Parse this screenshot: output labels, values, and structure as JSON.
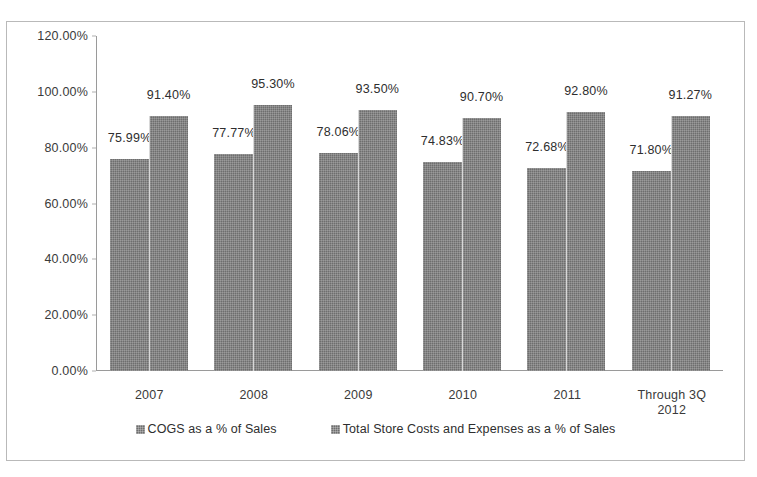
{
  "chart_data": {
    "type": "bar",
    "title": "",
    "subtitle": "",
    "xlabel": "",
    "ylabel": "",
    "ylim": [
      0,
      120
    ],
    "ytick_step": 20,
    "ytick_labels": [
      "0.00%",
      "20.00%",
      "40.00%",
      "60.00%",
      "80.00%",
      "100.00%",
      "120.00%"
    ],
    "ytick_values": [
      0,
      20,
      40,
      60,
      80,
      100,
      120
    ],
    "grid": false,
    "legend_position": "bottom",
    "categories": [
      "2007",
      "2008",
      "2009",
      "2010",
      "2011",
      "Through 3Q\n2012"
    ],
    "series": [
      {
        "name": "COGS as a % of Sales",
        "color": "#6e6e6e",
        "values": [
          75.99,
          77.77,
          78.06,
          74.83,
          72.68,
          71.8
        ],
        "labels": [
          "75.99%",
          "77.77%",
          "78.06%",
          "74.83%",
          "72.68%",
          "71.80%"
        ]
      },
      {
        "name": "Total Store Costs and Expenses as a % of Sales",
        "color": "#6e6e6e",
        "values": [
          91.4,
          95.3,
          93.5,
          90.7,
          92.8,
          91.27
        ],
        "labels": [
          "91.40%",
          "95.30%",
          "93.50%",
          "90.70%",
          "92.80%",
          "91.27%"
        ]
      }
    ]
  }
}
